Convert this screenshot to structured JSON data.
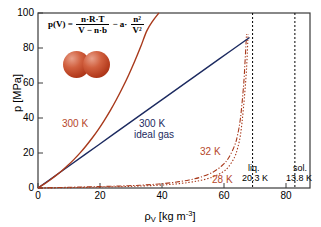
{
  "chart_data": {
    "type": "line",
    "title": "",
    "xlabel": "ρ_V [kg m^-3]",
    "ylabel": "p [MPa]",
    "xlim": [
      0,
      90
    ],
    "ylim": [
      0,
      100
    ],
    "grid": false,
    "legend_position": "inline-annotations",
    "x_ticks": [
      0,
      20,
      40,
      60,
      80
    ],
    "y_ticks": [
      0,
      20,
      40,
      60,
      80,
      100
    ],
    "annotations": [
      {
        "text": "300 K",
        "x": 12,
        "y": 38,
        "color": "#b5462a"
      },
      {
        "text": "300 K",
        "x": 36,
        "y": 38,
        "color": "#1c2a60"
      },
      {
        "text": "ideal gas",
        "x": 36,
        "y": 32,
        "color": "#1c2a60"
      },
      {
        "text": "32 K",
        "x": 56,
        "y": 22,
        "color": "#b5462a"
      },
      {
        "text": "28 K",
        "x": 58,
        "y": 4,
        "color": "#b5462a"
      },
      {
        "text": "liq.",
        "x": 71,
        "y": 10,
        "color": "#000000"
      },
      {
        "text": "20.3 K",
        "x": 71,
        "y": 6,
        "color": "#000000"
      },
      {
        "text": "sol.",
        "x": 85,
        "y": 10,
        "color": "#000000"
      },
      {
        "text": "13.8 K",
        "x": 85,
        "y": 6,
        "color": "#000000"
      }
    ],
    "vertical_lines": [
      {
        "label": "liq. 20.3 K",
        "x": 71,
        "style": "dotted",
        "color": "#000000"
      },
      {
        "label": "sol. 13.8 K",
        "x": 85,
        "style": "dotted",
        "color": "#000000"
      }
    ],
    "series": [
      {
        "name": "300 K van der Waals",
        "color": "#a8391b",
        "style": "solid",
        "x": [
          0,
          2,
          4,
          6,
          8,
          10,
          12,
          14,
          16,
          18,
          20,
          22,
          24,
          26,
          28,
          30,
          32,
          34,
          36,
          38,
          40
        ],
        "y": [
          0,
          2.2,
          4.6,
          7.2,
          10.0,
          13.1,
          16.5,
          20.2,
          24.3,
          28.7,
          33.5,
          38.8,
          44.5,
          50.7,
          57.4,
          64.6,
          72.4,
          80.8,
          89.8,
          95.5,
          100.0
        ]
      },
      {
        "name": "300 K ideal gas",
        "color": "#1c2a60",
        "style": "solid",
        "x": [
          0,
          10,
          20,
          30,
          40,
          50,
          60,
          70
        ],
        "y": [
          0,
          12.3,
          24.6,
          36.9,
          49.2,
          61.5,
          73.8,
          86.0
        ]
      },
      {
        "name": "32 K",
        "color": "#a8391b",
        "style": "dashdot",
        "x": [
          0,
          10,
          20,
          30,
          35,
          40,
          45,
          50,
          54,
          58,
          61,
          63,
          65,
          66,
          67,
          68,
          68.5,
          69
        ],
        "y": [
          0,
          0.4,
          0.8,
          1.3,
          1.7,
          2.3,
          3.2,
          4.6,
          6.3,
          9.2,
          13.0,
          17.0,
          24.0,
          30.0,
          40.0,
          58.0,
          72.0,
          88.0
        ]
      },
      {
        "name": "28 K",
        "color": "#a8391b",
        "style": "dotted",
        "x": [
          0,
          10,
          20,
          30,
          35,
          40,
          45,
          50,
          54,
          58,
          61,
          63,
          65,
          66,
          67,
          68,
          69,
          69.5
        ],
        "y": [
          0,
          0.2,
          0.5,
          0.9,
          1.2,
          1.6,
          2.2,
          3.2,
          4.4,
          6.4,
          9.0,
          12.0,
          17.5,
          22.5,
          30.5,
          46.0,
          68.0,
          88.0
        ]
      }
    ]
  },
  "axes": {
    "y_title_text": "p [MPa]",
    "x_title_rho": "ρ",
    "x_title_sub": "V",
    "x_title_unit": " [kg m",
    "x_title_sup": "-3",
    "x_title_close": "]",
    "x_tick_labels": [
      "0",
      "20",
      "40",
      "60",
      "80"
    ],
    "y_tick_labels": [
      "0",
      "20",
      "40",
      "60",
      "80",
      "100"
    ]
  },
  "formula": {
    "lhs": "p(V) =",
    "frac1_num": "n·R·T",
    "frac1_den": "V − n·b",
    "minus": "− a·",
    "frac2_num": "n²",
    "frac2_den": "V²"
  },
  "labels": {
    "curve_300k_real": "300 K",
    "curve_300k_ideal_line1": "300 K",
    "curve_300k_ideal_line2": "ideal gas",
    "curve_32k": "32 K",
    "curve_28k": "28 K",
    "liq_line1": "liq.",
    "liq_line2": "20.3 K",
    "sol_line1": "sol.",
    "sol_line2": "13.8 K"
  },
  "colors": {
    "red_curve": "#a8391b",
    "red_text": "#b5462a",
    "blue_curve": "#1c2a60",
    "frame": "#3a3a3a",
    "atom": "#c04a26"
  }
}
